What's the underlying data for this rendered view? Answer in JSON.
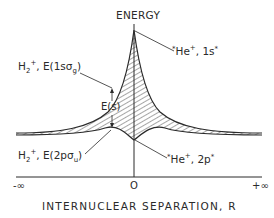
{
  "diagram": {
    "y_axis_label": "ENERGY",
    "x_axis_label": "INTERNUCLEAR SEPARATION, R",
    "x_ticks": [
      "-∞",
      "O",
      "+∞"
    ],
    "labels": {
      "upper_united_atom": {
        "species": "He",
        "charge": "+",
        "state": "1s",
        "marks": "*"
      },
      "upper_molecular": {
        "species": "H",
        "sub": "2",
        "charge": "+",
        "term": "E(1sσ",
        "term_sub": "g",
        "close": ")"
      },
      "splitting": "E(s)",
      "lower_molecular": {
        "species": "H",
        "sub": "2",
        "charge": "+",
        "term": "E(2pσ",
        "term_sub": "u",
        "close": ")"
      },
      "lower_united_atom": {
        "species": "He",
        "charge": "+",
        "state": "2p",
        "marks": "*"
      }
    },
    "colors": {
      "ink": "#2a2a2a",
      "background": "#ffffff"
    }
  }
}
